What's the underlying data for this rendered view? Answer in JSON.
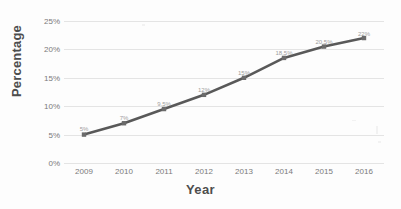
{
  "chart_data": {
    "type": "line",
    "title": "",
    "xlabel": "Year",
    "ylabel": "Percentage",
    "categories": [
      "2009",
      "2010",
      "2011",
      "2012",
      "2013",
      "2014",
      "2015",
      "2016"
    ],
    "values": [
      5,
      7,
      9.5,
      12,
      15,
      18.5,
      20.5,
      22
    ],
    "point_labels": [
      "5%",
      "7%",
      "9.5%",
      "12%",
      "15%",
      "18.5%",
      "20.5%",
      "22%"
    ],
    "ylim": [
      0,
      25
    ],
    "ytick_values": [
      0,
      5,
      10,
      15,
      20,
      25
    ],
    "ytick_labels": [
      "0%",
      "5%",
      "10%",
      "15%",
      "20%",
      "25%"
    ],
    "grid": true,
    "legend": "none",
    "series": [
      {
        "name": "Percentage",
        "color": "#595959",
        "values": [
          5,
          7,
          9.5,
          12,
          15,
          18.5,
          20.5,
          22
        ]
      }
    ]
  },
  "colors": {
    "line": "#595959",
    "marker": "#6b6b6b",
    "gridline": "#e4e4e4",
    "tick_text": "#7a7a7a",
    "axis_title": "#4d4d4d",
    "background": "#fdfdfd"
  }
}
